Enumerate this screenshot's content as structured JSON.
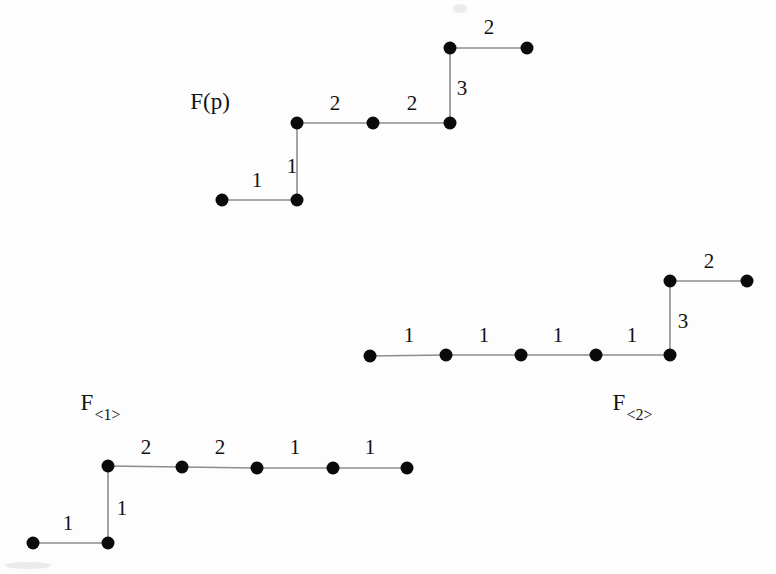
{
  "figure": {
    "width": 776,
    "height": 574,
    "background_color": "#fdfdfd",
    "node_color": "#0a0a0a",
    "edge_color": "#8d8d8d",
    "node_radius": 6.5
  },
  "chart_data": {
    "type": "diagram",
    "xlabel": "",
    "ylabel": "",
    "grid": false,
    "legend": "none",
    "graphs": [
      {
        "id": "F(p)",
        "label": "F(p)",
        "label_base": "F(p)",
        "label_sub": "",
        "label_pos": [
          210,
          101
        ],
        "nodes": [
          {
            "id": "p0",
            "x": 222,
            "y": 200
          },
          {
            "id": "p1",
            "x": 297,
            "y": 200
          },
          {
            "id": "p2",
            "x": 297,
            "y": 123
          },
          {
            "id": "p3",
            "x": 373,
            "y": 123
          },
          {
            "id": "p4",
            "x": 450,
            "y": 123
          },
          {
            "id": "p5",
            "x": 450,
            "y": 48
          },
          {
            "id": "p6",
            "x": 527,
            "y": 48
          }
        ],
        "edges": [
          {
            "from": "p0",
            "to": "p1",
            "weight": "1",
            "label_pos": [
              257,
              180
            ]
          },
          {
            "from": "p1",
            "to": "p2",
            "weight": "1",
            "label_pos": [
              292,
              166
            ]
          },
          {
            "from": "p2",
            "to": "p3",
            "weight": "2",
            "label_pos": [
              335,
              103
            ]
          },
          {
            "from": "p3",
            "to": "p4",
            "weight": "2",
            "label_pos": [
              412,
              103
            ]
          },
          {
            "from": "p4",
            "to": "p5",
            "weight": "3",
            "label_pos": [
              462,
              88
            ]
          },
          {
            "from": "p5",
            "to": "p6",
            "weight": "2",
            "label_pos": [
              489,
              27
            ]
          }
        ],
        "weight_sequence": [
          "1",
          "1",
          "2",
          "2",
          "3",
          "2"
        ]
      },
      {
        "id": "F<2>",
        "label": "F<2>",
        "label_base": "F",
        "label_sub": "<2>",
        "label_pos": [
          632,
          405
        ],
        "nodes": [
          {
            "id": "b0",
            "x": 370,
            "y": 356
          },
          {
            "id": "b1",
            "x": 446,
            "y": 355
          },
          {
            "id": "b2",
            "x": 521,
            "y": 355
          },
          {
            "id": "b3",
            "x": 596,
            "y": 355
          },
          {
            "id": "b4",
            "x": 670,
            "y": 355
          },
          {
            "id": "b5",
            "x": 670,
            "y": 281
          },
          {
            "id": "b6",
            "x": 747,
            "y": 281
          }
        ],
        "edges": [
          {
            "from": "b0",
            "to": "b1",
            "weight": "1",
            "label_pos": [
              409,
              335
            ]
          },
          {
            "from": "b1",
            "to": "b2",
            "weight": "1",
            "label_pos": [
              484,
              335
            ]
          },
          {
            "from": "b2",
            "to": "b3",
            "weight": "1",
            "label_pos": [
              558,
              335
            ]
          },
          {
            "from": "b3",
            "to": "b4",
            "weight": "1",
            "label_pos": [
              632,
              335
            ]
          },
          {
            "from": "b4",
            "to": "b5",
            "weight": "3",
            "label_pos": [
              683,
              321
            ]
          },
          {
            "from": "b5",
            "to": "b6",
            "weight": "2",
            "label_pos": [
              709,
              261
            ]
          }
        ],
        "weight_sequence": [
          "1",
          "1",
          "1",
          "1",
          "3",
          "2"
        ]
      },
      {
        "id": "F<1>",
        "label": "F<1>",
        "label_base": "F",
        "label_sub": "<1>",
        "label_pos": [
          100,
          405
        ],
        "nodes": [
          {
            "id": "c0",
            "x": 33,
            "y": 543
          },
          {
            "id": "c1",
            "x": 108,
            "y": 543
          },
          {
            "id": "c2",
            "x": 108,
            "y": 466
          },
          {
            "id": "c3",
            "x": 182,
            "y": 467
          },
          {
            "id": "c4",
            "x": 257,
            "y": 468
          },
          {
            "id": "c5",
            "x": 333,
            "y": 468
          },
          {
            "id": "c6",
            "x": 407,
            "y": 468
          }
        ],
        "edges": [
          {
            "from": "c0",
            "to": "c1",
            "weight": "1",
            "label_pos": [
              68,
              523
            ]
          },
          {
            "from": "c1",
            "to": "c2",
            "weight": "1",
            "label_pos": [
              122,
              508
            ]
          },
          {
            "from": "c2",
            "to": "c3",
            "weight": "2",
            "label_pos": [
              146,
              447
            ]
          },
          {
            "from": "c3",
            "to": "c4",
            "weight": "2",
            "label_pos": [
              220,
              447
            ]
          },
          {
            "from": "c4",
            "to": "c5",
            "weight": "1",
            "label_pos": [
              295,
              447
            ]
          },
          {
            "from": "c5",
            "to": "c6",
            "weight": "1",
            "label_pos": [
              370,
              447
            ]
          }
        ],
        "weight_sequence": [
          "1",
          "1",
          "2",
          "2",
          "1",
          "1"
        ]
      }
    ],
    "artifacts": [
      {
        "id": "smudge-top",
        "x": 453,
        "y": 4,
        "w": 14,
        "h": 9
      },
      {
        "id": "smudge-bottom-left",
        "x": 5,
        "y": 562,
        "w": 46,
        "h": 7
      }
    ]
  }
}
